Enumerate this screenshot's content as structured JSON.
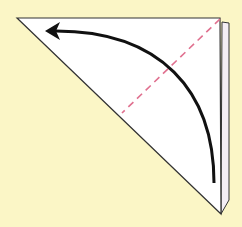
{
  "diagram": {
    "type": "origami-fold-step",
    "background_color": "#fbf6c6",
    "paper": {
      "shape": "right-triangle",
      "fill": "#ffffff",
      "edge_color": "#333333",
      "back_layer_fill": "#f4eef4"
    },
    "fold_line": {
      "style": "dashed",
      "color": "#e0708f"
    },
    "arrow": {
      "direction": "curved, bottom-right to top-left",
      "color": "#111111"
    }
  }
}
